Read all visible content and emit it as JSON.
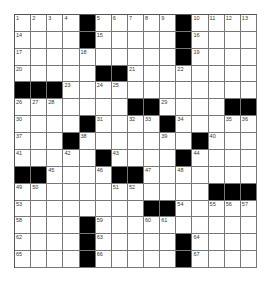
{
  "puzzle": {
    "rows": 15,
    "cols": 15,
    "colors": {
      "black": "#000000",
      "white": "#ffffff",
      "line": "#777777"
    },
    "grid": [
      [
        "1",
        "2",
        "3",
        "4",
        "#",
        "5",
        "6",
        "7",
        "8",
        "9",
        "#",
        "10",
        "11",
        "12",
        "13"
      ],
      [
        "14",
        "",
        "",
        "",
        "#",
        "15",
        "",
        "",
        "",
        "",
        "#",
        "16",
        "",
        "",
        ""
      ],
      [
        "17",
        "",
        "",
        "",
        "18",
        "",
        "",
        "",
        "",
        "",
        "#",
        "19",
        "",
        "",
        ""
      ],
      [
        "20",
        "",
        "",
        "",
        "",
        "#",
        "#",
        "21",
        "",
        "",
        "22",
        "",
        "",
        "",
        ""
      ],
      [
        "#",
        "#",
        "#",
        "23",
        "",
        "24",
        "25",
        "",
        "",
        "",
        "",
        "",
        "",
        "",
        ""
      ],
      [
        "26",
        "27",
        "28",
        "",
        "",
        "",
        "",
        "#",
        "#",
        "29",
        "",
        "",
        "",
        "#",
        "#"
      ],
      [
        "30",
        "",
        "",
        "",
        "#",
        "31",
        "",
        "32",
        "33",
        "#",
        "34",
        "",
        "",
        "35",
        "36"
      ],
      [
        "37",
        "",
        "",
        "#",
        "38",
        "",
        "",
        "",
        "",
        "39",
        "",
        "#",
        "40",
        "",
        ""
      ],
      [
        "41",
        "",
        "",
        "42",
        "",
        "#",
        "43",
        "",
        "",
        "",
        "#",
        "44",
        "",
        "",
        ""
      ],
      [
        "#",
        "#",
        "45",
        "",
        "",
        "46",
        "#",
        "#",
        "47",
        "",
        "48",
        "",
        "",
        "",
        ""
      ],
      [
        "49",
        "50",
        "",
        "",
        "",
        "",
        "51",
        "52",
        "",
        "",
        "",
        "",
        "#",
        "#",
        "#"
      ],
      [
        "53",
        "",
        "",
        "",
        "",
        "",
        "",
        "",
        "#",
        "#",
        "54",
        "",
        "55",
        "56",
        "57"
      ],
      [
        "58",
        "",
        "",
        "",
        "#",
        "59",
        "",
        "",
        "60",
        "61",
        "",
        "",
        "",
        "",
        ""
      ],
      [
        "62",
        "",
        "",
        "",
        "#",
        "63",
        "",
        "",
        "",
        "",
        "#",
        "64",
        "",
        "",
        ""
      ],
      [
        "65",
        "",
        "",
        "",
        "#",
        "66",
        "",
        "",
        "",
        "",
        "#",
        "67",
        "",
        "",
        ""
      ]
    ]
  }
}
